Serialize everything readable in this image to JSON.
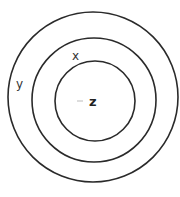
{
  "diagram": {
    "type": "concentric-circles",
    "center": {
      "x": 93,
      "y": 97
    },
    "circles": [
      {
        "id": "outer",
        "label": "y",
        "radius": 85
      },
      {
        "id": "middle",
        "label": "x",
        "radius": 63
      },
      {
        "id": "inner",
        "label": "z",
        "radius": 41
      }
    ],
    "labels": {
      "outer": "y",
      "middle": "x",
      "inner": "z"
    },
    "colors": {
      "stroke": "#2a2a2a",
      "background": "#ffffff"
    }
  }
}
